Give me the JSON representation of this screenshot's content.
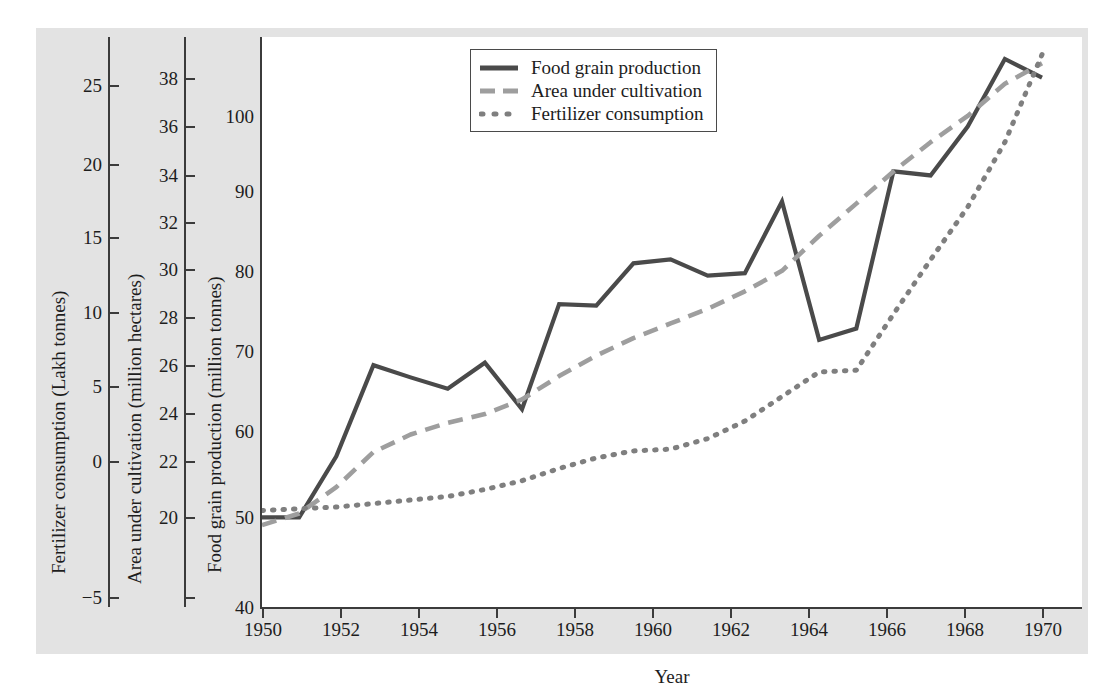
{
  "chart_data": {
    "type": "line",
    "title": "",
    "xlabel": "Year",
    "x": [
      1950,
      1951,
      1952,
      1953,
      1954,
      1955,
      1956,
      1957,
      1958,
      1959,
      1960,
      1961,
      1962,
      1963,
      1964,
      1965,
      1966,
      1967,
      1968,
      1969,
      1970,
      1971
    ],
    "xticks": [
      "1950",
      "1952",
      "1954",
      "1956",
      "1958",
      "1960",
      "1962",
      "1964",
      "1966",
      "1968",
      "1970"
    ],
    "xlim": [
      1950,
      1971
    ],
    "grid": false,
    "legend_position": "top-center",
    "series": [
      {
        "name": "Food grain production",
        "axis": "left-inner",
        "style": "solid",
        "color": "#4a4a4a",
        "unit": "million tonnes",
        "values": [
          51.0,
          51.0,
          58.5,
          69.7,
          68.2,
          66.8,
          70.0,
          64.3,
          77.2,
          77.0,
          82.2,
          82.7,
          80.7,
          81.0,
          89.8,
          72.8,
          74.2,
          93.5,
          93.0,
          99.0,
          107.3,
          105.0
        ]
      },
      {
        "name": "Area under cultivation",
        "axis": "middle",
        "style": "dashed",
        "color": "#9a9a9a",
        "unit": "million hectares",
        "values": [
          22.3,
          22.7,
          23.6,
          24.8,
          25.4,
          25.8,
          26.1,
          26.6,
          27.4,
          28.1,
          28.7,
          29.2,
          29.7,
          30.3,
          31.0,
          32.2,
          33.3,
          34.4,
          35.4,
          36.3,
          37.4,
          38.1
        ]
      },
      {
        "name": "Fertilizer consumption",
        "axis": "outer-left",
        "style": "dotted",
        "color": "#7d7d7d",
        "unit": "Lakh tonnes",
        "values": [
          0.5,
          0.6,
          0.7,
          0.9,
          1.1,
          1.3,
          1.7,
          2.2,
          2.9,
          3.5,
          3.9,
          4.0,
          4.6,
          5.6,
          7.0,
          8.4,
          8.5,
          11.7,
          14.8,
          17.8,
          21.5,
          26.5
        ]
      }
    ],
    "axes": [
      {
        "id": "fertilizer",
        "title": "Fertilizer consumption (Lakh tonnes)",
        "ticks": [
          "25",
          "20",
          "15",
          "10",
          "5",
          "0",
          "−5"
        ],
        "lim": [
          -5,
          27.5
        ]
      },
      {
        "id": "area",
        "title": "Area under cultivation (million hectares)",
        "ticks": [
          "38",
          "36",
          "34",
          "32",
          "30",
          "28",
          "26",
          "24",
          "22",
          "20"
        ],
        "lim": [
          19.5,
          39.0
        ]
      },
      {
        "id": "production",
        "title": "Food grain production (million tonnes)",
        "ticks": [
          "100",
          "90",
          "80",
          "70",
          "60",
          "50",
          "40"
        ],
        "lim": [
          40,
          110
        ]
      }
    ],
    "legend": [
      {
        "label": "Food grain production",
        "style": "solid"
      },
      {
        "label": "Area under cultivation",
        "style": "dashed"
      },
      {
        "label": "Fertilizer consumption",
        "style": "dotted"
      }
    ]
  }
}
